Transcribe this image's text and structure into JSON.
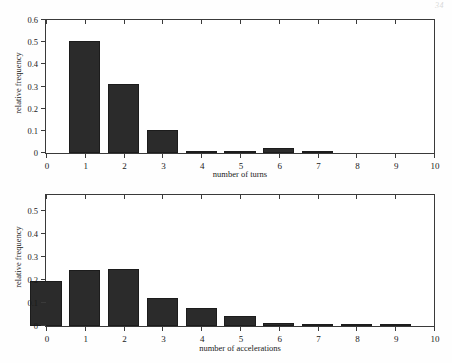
{
  "page": {
    "number": "34"
  },
  "figures": [
    {
      "id": "turns",
      "xlabel": "number of turns",
      "ylabel": "relative frequency",
      "ytick_labels": [
        "0",
        "0.1",
        "0.2",
        "0.3",
        "0.4",
        "0.5",
        "0.6"
      ],
      "xtick_labels": [
        "0",
        "1",
        "2",
        "3",
        "4",
        "5",
        "6",
        "7",
        "8",
        "9",
        "10"
      ]
    },
    {
      "id": "accel",
      "xlabel": "number of accelerations",
      "ylabel": "relative frequency",
      "ytick_labels": [
        "0",
        "0.1",
        "0.2",
        "0.3",
        "0.4",
        "0.5"
      ],
      "xtick_labels": [
        "0",
        "1",
        "2",
        "3",
        "4",
        "5",
        "6",
        "7",
        "8",
        "9",
        "10"
      ]
    }
  ],
  "chart_data": [
    {
      "type": "bar",
      "title": "",
      "xlabel": "number of turns",
      "ylabel": "relative frequency",
      "categories": [
        "0",
        "1",
        "2",
        "3",
        "4",
        "5",
        "6",
        "7",
        "8",
        "9",
        "10"
      ],
      "values": [
        0.0,
        0.505,
        0.313,
        0.105,
        0.01,
        0.003,
        0.021,
        0.004,
        0.0,
        0.0,
        0.0
      ],
      "xlim": [
        0,
        10
      ],
      "ylim": [
        0,
        0.6
      ],
      "ytick_values": [
        0,
        0.1,
        0.2,
        0.3,
        0.4,
        0.5,
        0.6
      ],
      "xtick_values": [
        0,
        1,
        2,
        3,
        4,
        5,
        6,
        7,
        8,
        9,
        10
      ],
      "bar_width": 0.8,
      "bar_color": "#2b2b2b",
      "grid": false,
      "legend": "none"
    },
    {
      "type": "bar",
      "title": "",
      "xlabel": "number of accelerations",
      "ylabel": "relative frequency",
      "categories": [
        "0",
        "1",
        "2",
        "3",
        "4",
        "5",
        "6",
        "7",
        "8",
        "9",
        "10"
      ],
      "values": [
        0.195,
        0.242,
        0.247,
        0.12,
        0.08,
        0.045,
        0.011,
        0.004,
        0.005,
        0.002,
        0.0
      ],
      "xlim": [
        0,
        10
      ],
      "ylim": [
        0,
        0.57
      ],
      "ytick_values": [
        0,
        0.1,
        0.2,
        0.3,
        0.4,
        0.5
      ],
      "xtick_values": [
        0,
        1,
        2,
        3,
        4,
        5,
        6,
        7,
        8,
        9,
        10
      ],
      "bar_width": 0.8,
      "bar_color": "#2b2b2b",
      "grid": false,
      "legend": "none"
    }
  ]
}
